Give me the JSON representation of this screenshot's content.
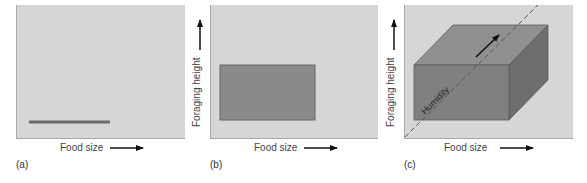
{
  "figure": {
    "panels": [
      {
        "id": "a",
        "label": "(a)",
        "x_axis_label": "Food size",
        "y_axis_label": "",
        "shape": "line",
        "description": "1D niche along food size"
      },
      {
        "id": "b",
        "label": "(b)",
        "x_axis_label": "Food size",
        "y_axis_label": "Foraging height",
        "shape": "rectangle",
        "description": "2D niche: food size x foraging height"
      },
      {
        "id": "c",
        "label": "(c)",
        "x_axis_label": "Food size",
        "y_axis_label": "Foraging height",
        "z_axis_label": "Humidity",
        "shape": "box",
        "description": "3D niche: food size x foraging height x humidity"
      }
    ],
    "colors": {
      "panel_bg": "#d6d6d6",
      "shape_fill": "#8a8a8a",
      "box_top": "#909090",
      "box_side": "#6e6e6e",
      "line": "#6a6a6a",
      "arrow": "#111111"
    }
  }
}
